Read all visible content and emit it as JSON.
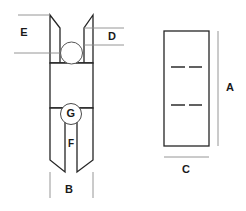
{
  "drawing": {
    "title": "V-Groove Pulley Dimension Drawing",
    "views": {
      "front": {
        "name": "front-section-view",
        "description": "Sectioned front view of V-groove pulley showing groove profile, hub bore and web slot"
      },
      "side": {
        "name": "side-view",
        "description": "Side profile rectangle with two hidden centerline pairs"
      }
    },
    "dimensions": [
      {
        "id": "A",
        "label": "A",
        "view": "side",
        "orientation": "vertical",
        "note": "Overall height of side view"
      },
      {
        "id": "B",
        "label": "B",
        "view": "front",
        "orientation": "horizontal",
        "note": "Overall outside width of pulley"
      },
      {
        "id": "C",
        "label": "C",
        "view": "side",
        "orientation": "horizontal",
        "note": "Overall width of side view"
      },
      {
        "id": "D",
        "label": "D",
        "view": "front",
        "orientation": "vertical",
        "note": "Groove depth to bore centre"
      },
      {
        "id": "E",
        "label": "E",
        "view": "front",
        "orientation": "vertical",
        "note": "Distance from top face to bore centreline"
      },
      {
        "id": "F",
        "label": "F",
        "view": "front",
        "orientation": "vertical",
        "note": "Web slot callout"
      },
      {
        "id": "G",
        "label": "G",
        "view": "front",
        "orientation": "balloon",
        "note": "Balloon callout at slot head"
      }
    ],
    "colors": {
      "outline": "#262626",
      "dimension_line": "#8a8a8a",
      "text": "#1a1a1a",
      "background": "#ffffff",
      "centerline": "#3a3a3a"
    }
  }
}
